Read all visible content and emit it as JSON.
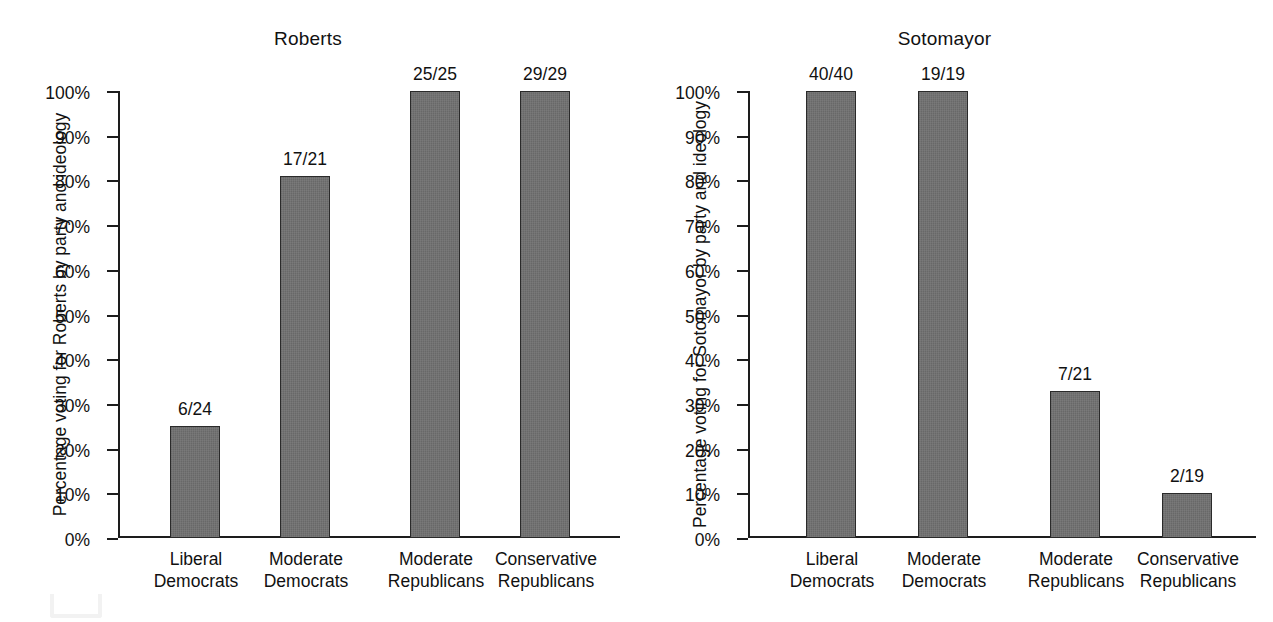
{
  "figure": {
    "background": "#ffffff",
    "bar_fill": "#6e6e6e",
    "bar_stroke": "#2a2a2a",
    "axis_color": "#1d1d1d"
  },
  "chart_data": [
    {
      "type": "bar",
      "title": "Roberts",
      "xlabel": "",
      "ylabel": "Percentage voting for Roberts by party and ideology",
      "categories": [
        "Liberal Democrats",
        "Moderate Democrats",
        "Moderate Republicans",
        "Conservative Republicans"
      ],
      "category_lines": [
        [
          "Liberal",
          "Democrats"
        ],
        [
          "Moderate",
          "Democrats"
        ],
        [
          "Moderate",
          "Republicans"
        ],
        [
          "Conservative",
          "Republicans"
        ]
      ],
      "values": [
        25,
        81,
        100,
        100
      ],
      "data_labels": [
        "6/24",
        "17/21",
        "25/25",
        "29/29"
      ],
      "ylim": [
        0,
        100
      ],
      "yticks": [
        0,
        10,
        20,
        30,
        40,
        50,
        60,
        70,
        80,
        90,
        100
      ],
      "ytick_labels": [
        "0%",
        "10%",
        "20%",
        "30%",
        "40%",
        "50%",
        "60%",
        "70%",
        "80%",
        "90%",
        "100%"
      ],
      "grid": false,
      "legend": false
    },
    {
      "type": "bar",
      "title": "Sotomayor",
      "xlabel": "",
      "ylabel": "Percentage voting for Sotomayor by party and ideology",
      "categories": [
        "Liberal Democrats",
        "Moderate Democrats",
        "Moderate Republicans",
        "Conservative Republicans"
      ],
      "category_lines": [
        [
          "Liberal",
          "Democrats"
        ],
        [
          "Moderate",
          "Democrats"
        ],
        [
          "Moderate",
          "Republicans"
        ],
        [
          "Conservative",
          "Republicans"
        ]
      ],
      "values": [
        100,
        100,
        33,
        10
      ],
      "data_labels": [
        "40/40",
        "19/19",
        "7/21",
        "2/19"
      ],
      "ylim": [
        0,
        100
      ],
      "yticks": [
        0,
        10,
        20,
        30,
        40,
        50,
        60,
        70,
        80,
        90,
        100
      ],
      "ytick_labels": [
        "0%",
        "10%",
        "20%",
        "30%",
        "40%",
        "50%",
        "60%",
        "70%",
        "80%",
        "90%",
        "100%"
      ],
      "grid": false,
      "legend": false
    }
  ],
  "roberts": {
    "title": "Roberts",
    "ylabel": "Percentage voting for Roberts by party and ideology",
    "ticks": [
      "100%",
      "90%",
      "80%",
      "70%",
      "60%",
      "50%",
      "40%",
      "30%",
      "20%",
      "10%",
      "0%"
    ],
    "bars": [
      {
        "label": "6/24",
        "cat_line1": "Liberal",
        "cat_line2": "Democrats",
        "pct": 25
      },
      {
        "label": "17/21",
        "cat_line1": "Moderate",
        "cat_line2": "Democrats",
        "pct": 81
      },
      {
        "label": "25/25",
        "cat_line1": "Moderate",
        "cat_line2": "Republicans",
        "pct": 100
      },
      {
        "label": "29/29",
        "cat_line1": "Conservative",
        "cat_line2": "Republicans",
        "pct": 100
      }
    ]
  },
  "sotomayor": {
    "title": "Sotomayor",
    "ylabel": "Percentage voting for Sotomayor by party and ideology",
    "ticks": [
      "100%",
      "90%",
      "80%",
      "70%",
      "60%",
      "50%",
      "40%",
      "30%",
      "20%",
      "10%",
      "0%"
    ],
    "bars": [
      {
        "label": "40/40",
        "cat_line1": "Liberal",
        "cat_line2": "Democrats",
        "pct": 100
      },
      {
        "label": "19/19",
        "cat_line1": "Moderate",
        "cat_line2": "Democrats",
        "pct": 100
      },
      {
        "label": "7/21",
        "cat_line1": "Moderate",
        "cat_line2": "Republicans",
        "pct": 33
      },
      {
        "label": "2/19",
        "cat_line1": "Conservative",
        "cat_line2": "Republicans",
        "pct": 10
      }
    ]
  }
}
